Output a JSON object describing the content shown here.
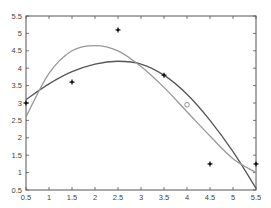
{
  "chart_data": {
    "type": "scatter",
    "title": "",
    "xlabel": "",
    "ylabel": "",
    "xlim": [
      0.5,
      5.5
    ],
    "ylim": [
      0.5,
      5.5
    ],
    "grid": false,
    "legend": null,
    "x_ticks": [
      "0.5",
      "1",
      "1.5",
      "2",
      "2.5",
      "3",
      "3.5",
      "4",
      "4.5",
      "5",
      "5.5"
    ],
    "y_ticks": [
      "0.5",
      "1",
      "1.5",
      "2",
      "2.5",
      "3",
      "3.5",
      "4",
      "4.5",
      "5",
      "5.5"
    ],
    "series": [
      {
        "name": "data points",
        "kind": "scatter",
        "marker": "plus-dot",
        "color": "#111111",
        "x": [
          0.5,
          1.5,
          2.5,
          3.5,
          4.5,
          5.5
        ],
        "y": [
          3.0,
          3.6,
          5.1,
          3.8,
          1.25,
          1.25
        ]
      },
      {
        "name": "fit curve (dark)",
        "kind": "line",
        "color": "#555555",
        "x": [
          0.5,
          1.0,
          1.5,
          2.0,
          2.5,
          3.0,
          3.5,
          4.0,
          4.5,
          5.0,
          5.5
        ],
        "y": [
          3.1,
          3.55,
          3.9,
          4.12,
          4.2,
          4.12,
          3.8,
          3.25,
          2.5,
          1.6,
          0.55
        ]
      },
      {
        "name": "fit curve (light)",
        "kind": "line",
        "color": "#999999",
        "x": [
          0.5,
          1.0,
          1.5,
          2.0,
          2.5,
          3.0,
          3.5,
          4.0,
          4.5,
          5.0,
          5.5
        ],
        "y": [
          2.6,
          3.85,
          4.5,
          4.65,
          4.5,
          4.05,
          3.45,
          2.75,
          2.05,
          1.4,
          1.0
        ]
      },
      {
        "name": "marked point",
        "kind": "scatter",
        "marker": "circle-open",
        "color": "#888888",
        "x": [
          4.0
        ],
        "y": [
          2.95
        ]
      }
    ]
  }
}
